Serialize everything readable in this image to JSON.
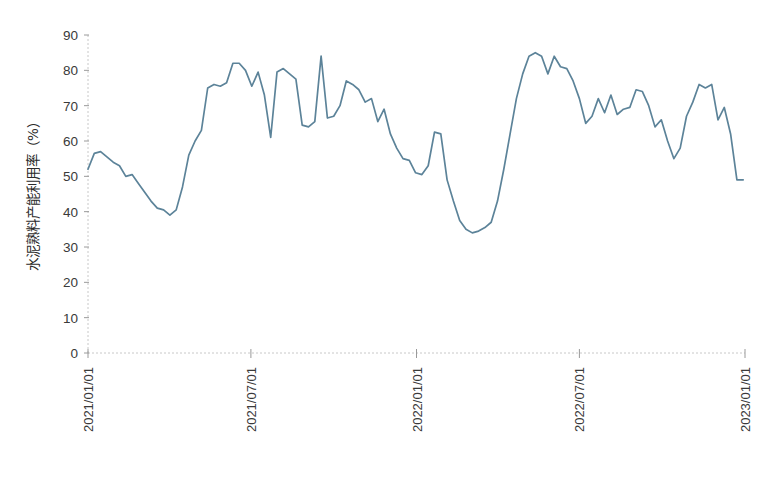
{
  "chart_data": {
    "type": "line",
    "title": "",
    "subtitle": "",
    "xlabel": "",
    "ylabel": "水泥熟料产能利用率（%）",
    "ylim": [
      0,
      90
    ],
    "ytick_labels": [
      "0",
      "10",
      "20",
      "30",
      "40",
      "50",
      "60",
      "70",
      "80",
      "90"
    ],
    "ytick_values": [
      0,
      10,
      20,
      30,
      40,
      50,
      60,
      70,
      80,
      90
    ],
    "xtick_labels": [
      "2021/01/01",
      "2021/07/01",
      "2022/01/01",
      "2022/07/01",
      "2023/01/01"
    ],
    "xtick_dates": [
      "2021-01-01",
      "2021-07-01",
      "2022-01-01",
      "2022-07-01",
      "2023-01-01"
    ],
    "xlim": [
      "2021-01-01",
      "2023-01-01"
    ],
    "grid": false,
    "legend": null,
    "legend_position": "none",
    "series_color": "#5c8399",
    "axis_color": "#c8c8c8",
    "x_axis_style": "dashed",
    "series": [
      {
        "name": "水泥熟料产能利用率",
        "color": "#5c8399",
        "x": [
          "2021-01-01",
          "2021-01-08",
          "2021-01-15",
          "2021-01-22",
          "2021-01-29",
          "2021-02-05",
          "2021-02-12",
          "2021-02-19",
          "2021-02-26",
          "2021-03-05",
          "2021-03-12",
          "2021-03-19",
          "2021-03-26",
          "2021-04-02",
          "2021-04-09",
          "2021-04-16",
          "2021-04-23",
          "2021-04-30",
          "2021-05-07",
          "2021-05-14",
          "2021-05-21",
          "2021-05-28",
          "2021-06-04",
          "2021-06-11",
          "2021-06-18",
          "2021-06-25",
          "2021-07-02",
          "2021-07-09",
          "2021-07-16",
          "2021-07-23",
          "2021-07-30",
          "2021-08-06",
          "2021-08-13",
          "2021-08-20",
          "2021-08-27",
          "2021-09-03",
          "2021-09-10",
          "2021-09-17",
          "2021-09-24",
          "2021-10-01",
          "2021-10-08",
          "2021-10-15",
          "2021-10-22",
          "2021-10-29",
          "2021-11-05",
          "2021-11-12",
          "2021-11-19",
          "2021-11-26",
          "2021-12-03",
          "2021-12-10",
          "2021-12-17",
          "2021-12-24",
          "2021-12-31",
          "2022-01-07",
          "2022-01-14",
          "2022-01-21",
          "2022-01-28",
          "2022-02-04",
          "2022-02-11",
          "2022-02-18",
          "2022-02-25",
          "2022-03-04",
          "2022-03-11",
          "2022-03-18",
          "2022-03-25",
          "2022-04-01",
          "2022-04-08",
          "2022-04-15",
          "2022-04-22",
          "2022-04-29",
          "2022-05-06",
          "2022-05-13",
          "2022-05-20",
          "2022-05-27",
          "2022-06-03",
          "2022-06-10",
          "2022-06-17",
          "2022-06-24",
          "2022-07-01",
          "2022-07-08",
          "2022-07-15",
          "2022-07-22",
          "2022-07-29",
          "2022-08-05",
          "2022-08-12",
          "2022-08-19",
          "2022-08-26",
          "2022-09-02",
          "2022-09-09",
          "2022-09-16",
          "2022-09-23",
          "2022-09-30",
          "2022-10-07",
          "2022-10-14",
          "2022-10-21",
          "2022-10-28",
          "2022-11-04",
          "2022-11-11",
          "2022-11-18",
          "2022-11-25",
          "2022-12-02",
          "2022-12-09",
          "2022-12-16",
          "2022-12-23",
          "2022-12-30"
        ],
        "values": [
          52.0,
          56.5,
          57.0,
          55.5,
          54.0,
          53.0,
          50.0,
          50.5,
          48.0,
          45.5,
          43.0,
          41.0,
          40.5,
          39.0,
          40.5,
          47.0,
          56.0,
          60.0,
          63.0,
          75.0,
          76.0,
          75.5,
          76.5,
          82.0,
          82.0,
          80.0,
          75.5,
          79.5,
          73.0,
          61.0,
          79.5,
          80.5,
          79.0,
          77.5,
          64.5,
          64.0,
          65.5,
          84.0,
          66.5,
          67.0,
          70.0,
          77.0,
          76.0,
          74.5,
          71.0,
          72.0,
          65.5,
          69.0,
          62.0,
          58.0,
          55.0,
          54.5,
          51.0,
          50.5,
          53.0,
          62.5,
          62.0,
          49.0,
          43.0,
          37.5,
          35.0,
          34.0,
          34.5,
          35.5,
          37.0,
          43.0,
          52.0,
          62.0,
          72.0,
          79.0,
          84.0,
          85.0,
          84.0,
          79.0,
          84.0,
          81.0,
          80.5,
          77.0,
          72.0,
          65.0,
          67.0,
          72.0,
          68.0,
          73.0,
          67.5,
          69.0,
          69.5,
          74.5,
          74.0,
          70.0,
          64.0,
          66.0,
          60.0,
          55.0,
          58.0,
          67.0,
          71.0,
          76.0,
          75.0,
          76.0,
          66.0,
          69.5,
          62.0,
          49.0,
          49.0
        ]
      }
    ]
  },
  "axis": {
    "y_title": "水泥熟料产能利用率（%）"
  }
}
